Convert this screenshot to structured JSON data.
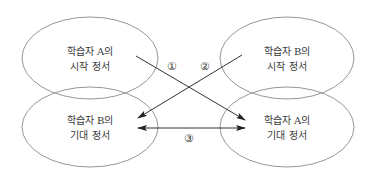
{
  "diagram": {
    "nodes": [
      {
        "id": "a-start",
        "line1": "학습자 A의",
        "line2": "시작 정서"
      },
      {
        "id": "b-start",
        "line1": "학습자 B의",
        "line2": "시작 정서"
      },
      {
        "id": "b-expect",
        "line1": "학습자 B의",
        "line2": "기대 정서"
      },
      {
        "id": "a-expect",
        "line1": "학습자 A의",
        "line2": "기대 정서"
      }
    ],
    "edges": [
      {
        "id": "edge-1",
        "from": "a-start",
        "to": "a-expect",
        "label": "①",
        "direction": "forward"
      },
      {
        "id": "edge-2",
        "from": "b-start",
        "to": "b-expect",
        "label": "②",
        "direction": "forward"
      },
      {
        "id": "edge-3",
        "from": "b-expect",
        "to": "a-expect",
        "label": "③",
        "direction": "both"
      }
    ],
    "colors": {
      "ellipse_stroke": "#8a8a8a",
      "arrow": "#333333",
      "text": "#3a3a3a"
    }
  }
}
